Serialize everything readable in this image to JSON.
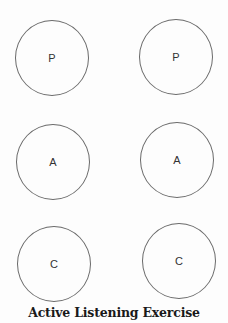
{
  "diagram": {
    "title": "Active Listening Exercise",
    "circles": [
      {
        "label": "P",
        "row": 1,
        "column": 1
      },
      {
        "label": "P",
        "row": 1,
        "column": 2
      },
      {
        "label": "A",
        "row": 2,
        "column": 1
      },
      {
        "label": "A",
        "row": 2,
        "column": 2
      },
      {
        "label": "C",
        "row": 3,
        "column": 1
      },
      {
        "label": "C",
        "row": 3,
        "column": 2
      }
    ],
    "colors": {
      "circle_stroke": "#6a6a6a",
      "label_text": "#333333",
      "title_text": "#1a1a1a",
      "background": "#fdfdfd"
    }
  }
}
